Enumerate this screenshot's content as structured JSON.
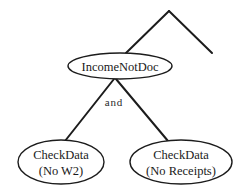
{
  "diagram": {
    "type": "proof-tree",
    "background_color": "#ffffff",
    "stroke_color": "#1c1c1c",
    "text_color": "#1a1a1a",
    "root": {
      "id": "income-not-doc",
      "label": "IncomeNotDoc",
      "shape": "ellipse",
      "cx": 120,
      "cy": 66,
      "rx": 52,
      "ry": 13
    },
    "edge_label": {
      "id": "and-connector",
      "text": "and",
      "x": 114,
      "y": 106
    },
    "children": [
      {
        "id": "check-data-no-w2",
        "line1": "CheckData",
        "line2": "(No  W2)",
        "shape": "ellipse",
        "cx": 61,
        "cy": 162,
        "rx": 43,
        "ry": 22
      },
      {
        "id": "check-data-no-receipts",
        "line1": "CheckData",
        "line2": "(No  Receipts)",
        "shape": "ellipse",
        "cx": 181,
        "cy": 162,
        "rx": 51,
        "ry": 22
      }
    ],
    "apex": {
      "id": "tree-apex",
      "x": 169,
      "y": 11
    },
    "edges": [
      {
        "id": "apex-left-edge",
        "x1": 169,
        "y1": 11,
        "x2": 126,
        "y2": 53
      },
      {
        "id": "apex-right-edge",
        "x1": 169,
        "y1": 11,
        "x2": 212,
        "y2": 53
      },
      {
        "id": "root-to-left-child",
        "x1": 114,
        "y1": 79,
        "x2": 65,
        "y2": 141
      },
      {
        "id": "root-to-right-child",
        "x1": 116,
        "y1": 79,
        "x2": 168,
        "y2": 141
      }
    ]
  }
}
